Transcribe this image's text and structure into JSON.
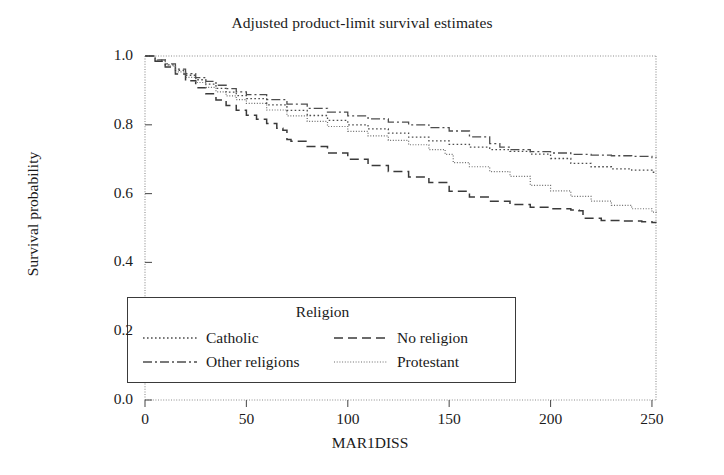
{
  "chart_data": {
    "type": "line",
    "title": "Adjusted product-limit survival estimates",
    "xlabel": "MAR1DISS",
    "ylabel": "Survival probability",
    "xlim": [
      0,
      252
    ],
    "ylim": [
      0.0,
      1.0
    ],
    "grid": false,
    "legend_position": "inside-lower-left",
    "legend_title": "Religion",
    "xticks": [
      0,
      50,
      100,
      150,
      200,
      250
    ],
    "xtick_labels": [
      "0",
      "50",
      "100",
      "150",
      "200",
      "250"
    ],
    "yticks": [
      0.0,
      0.2,
      0.4,
      0.6,
      0.8,
      1.0
    ],
    "ytick_labels": [
      "0.0",
      "0.2",
      "0.4",
      "0.6",
      "0.8",
      "1.0"
    ],
    "series": [
      {
        "name": "Catholic",
        "dash": "dotted",
        "color": "#4d4d4d",
        "x": [
          0,
          5,
          10,
          15,
          20,
          25,
          30,
          35,
          40,
          45,
          50,
          60,
          70,
          80,
          90,
          100,
          110,
          120,
          130,
          140,
          150,
          160,
          170,
          180,
          190,
          200,
          210,
          220,
          230,
          240,
          250,
          252
        ],
        "y": [
          1.0,
          0.988,
          0.974,
          0.958,
          0.944,
          0.931,
          0.918,
          0.906,
          0.895,
          0.885,
          0.876,
          0.858,
          0.842,
          0.827,
          0.813,
          0.8,
          0.788,
          0.776,
          0.764,
          0.753,
          0.743,
          0.735,
          0.728,
          0.723,
          0.715,
          0.702,
          0.688,
          0.678,
          0.672,
          0.668,
          0.662,
          0.66
        ]
      },
      {
        "name": "No religion",
        "dash": "dashed",
        "color": "#3a3a3a",
        "x": [
          0,
          5,
          10,
          15,
          20,
          25,
          30,
          35,
          40,
          45,
          50,
          55,
          60,
          65,
          68,
          70,
          72,
          80,
          90,
          100,
          110,
          120,
          130,
          140,
          150,
          160,
          170,
          180,
          190,
          200,
          210,
          214,
          216,
          225,
          235,
          245,
          250,
          252
        ],
        "y": [
          1.0,
          0.985,
          0.968,
          0.948,
          0.928,
          0.908,
          0.89,
          0.872,
          0.856,
          0.842,
          0.828,
          0.816,
          0.804,
          0.79,
          0.784,
          0.757,
          0.752,
          0.737,
          0.718,
          0.7,
          0.682,
          0.664,
          0.648,
          0.632,
          0.607,
          0.59,
          0.578,
          0.568,
          0.56,
          0.556,
          0.552,
          0.55,
          0.528,
          0.522,
          0.52,
          0.518,
          0.516,
          0.515
        ]
      },
      {
        "name": "Other religions",
        "dash": "dashdot",
        "color": "#4d4d4d",
        "x": [
          0,
          5,
          10,
          15,
          20,
          25,
          30,
          35,
          40,
          45,
          50,
          60,
          70,
          80,
          90,
          100,
          110,
          120,
          130,
          140,
          150,
          160,
          170,
          175,
          180,
          190,
          200,
          210,
          220,
          230,
          240,
          250,
          252
        ],
        "y": [
          1.0,
          0.989,
          0.977,
          0.962,
          0.949,
          0.937,
          0.926,
          0.915,
          0.905,
          0.896,
          0.888,
          0.873,
          0.86,
          0.848,
          0.837,
          0.826,
          0.817,
          0.808,
          0.8,
          0.792,
          0.782,
          0.765,
          0.745,
          0.735,
          0.728,
          0.722,
          0.718,
          0.714,
          0.712,
          0.71,
          0.708,
          0.705,
          0.704
        ]
      },
      {
        "name": "Protestant",
        "dash": "fine-dotted",
        "color": "#6b6b6b",
        "x": [
          0,
          5,
          10,
          15,
          20,
          25,
          30,
          35,
          40,
          45,
          50,
          60,
          70,
          80,
          90,
          100,
          110,
          120,
          130,
          140,
          148,
          152,
          160,
          170,
          180,
          190,
          200,
          210,
          220,
          230,
          240,
          250,
          252
        ],
        "y": [
          1.0,
          0.987,
          0.971,
          0.954,
          0.938,
          0.923,
          0.909,
          0.896,
          0.884,
          0.873,
          0.862,
          0.843,
          0.826,
          0.81,
          0.795,
          0.781,
          0.768,
          0.755,
          0.742,
          0.728,
          0.714,
          0.69,
          0.678,
          0.664,
          0.65,
          0.624,
          0.608,
          0.592,
          0.578,
          0.566,
          0.556,
          0.546,
          0.544
        ]
      }
    ]
  },
  "axes": {
    "frame_color": "#8c8c8c"
  },
  "legend": {
    "title": "Religion",
    "entries": [
      {
        "label": "Catholic"
      },
      {
        "label": "Other religions"
      },
      {
        "label": "No religion"
      },
      {
        "label": "Protestant"
      }
    ]
  }
}
